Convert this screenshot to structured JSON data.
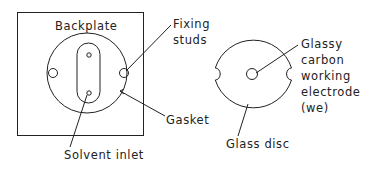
{
  "diagram": {
    "left": {
      "title": "Backplate",
      "labels": {
        "fixing_studs": [
          "Fixing",
          "studs"
        ],
        "gasket": "Gasket",
        "solvent_inlet": "Solvent inlet"
      }
    },
    "right": {
      "labels": {
        "electrode": [
          "Glassy",
          "carbon",
          "working",
          "electrode",
          "(we)"
        ],
        "glass_disc": "Glass disc"
      }
    },
    "colors": {
      "stroke": "#222222",
      "background": "#ffffff"
    }
  }
}
